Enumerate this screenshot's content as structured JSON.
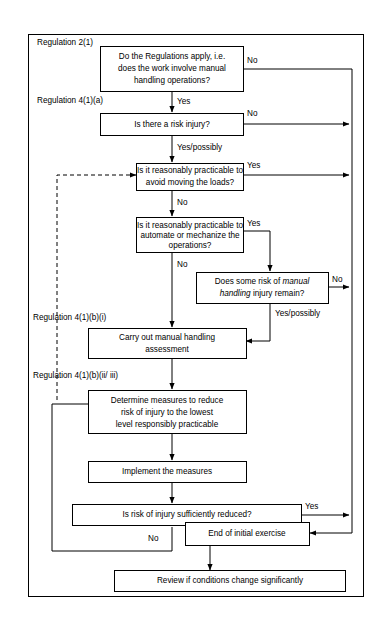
{
  "diagram": {
    "colors": {
      "line": "#000000",
      "box_fill": "#ffffff",
      "background": "#ffffff"
    },
    "section_labels": [
      {
        "id": "reg-2-1",
        "text": "Regulation 2(1)"
      },
      {
        "id": "reg-4-1-a",
        "text": "Regulation 4(1)(a)"
      },
      {
        "id": "reg-4-1-b-i",
        "text": "Regulation 4(1)(b)(i)"
      },
      {
        "id": "reg-4-1-b-ii-iii",
        "text": "Regulation 4(1)(b)(ii/ iii)"
      }
    ],
    "nodes": [
      {
        "id": "regulations-apply",
        "kind": "decision",
        "lines": [
          "Do the Regulations apply, i.e.",
          "does the work involve manual",
          "handling operations?"
        ]
      },
      {
        "id": "risk-injury",
        "kind": "decision",
        "lines": [
          "Is there a risk injury?"
        ]
      },
      {
        "id": "avoid-moving-loads",
        "kind": "decision",
        "lines": [
          "Is it reasonably practicable to",
          "avoid moving the loads?"
        ]
      },
      {
        "id": "automate-mechanize",
        "kind": "decision",
        "lines": [
          "Is it reasonably practicable to",
          "automate or mechanize the",
          "operations?"
        ]
      },
      {
        "id": "risk-remains",
        "kind": "decision",
        "lines_rich": [
          [
            {
              "t": "Does some risk of ",
              "style": "normal"
            },
            {
              "t": "manual",
              "style": "italic"
            }
          ],
          [
            {
              "t": "handling",
              "style": "italic"
            },
            {
              "t": " injury remain?",
              "style": "normal"
            }
          ]
        ]
      },
      {
        "id": "carry-out-assessment",
        "kind": "process",
        "lines": [
          "Carry out manual handling",
          "assessment"
        ]
      },
      {
        "id": "determine-measures",
        "kind": "process",
        "lines": [
          "Determine measures to reduce",
          "risk of injury to the lowest",
          "level responsibly practicable"
        ]
      },
      {
        "id": "implement-measures",
        "kind": "process",
        "lines": [
          "Implement the measures"
        ]
      },
      {
        "id": "risk-sufficiently-reduced",
        "kind": "decision",
        "lines": [
          "Is risk of injury sufficiently reduced?"
        ]
      },
      {
        "id": "end-initial-exercise",
        "kind": "terminal",
        "lines": [
          "End of initial exercise"
        ]
      },
      {
        "id": "review-conditions",
        "kind": "terminal",
        "lines": [
          "Review if conditions change significantly"
        ]
      }
    ],
    "edge_labels": [
      {
        "id": "regulations-apply-no",
        "text": "No"
      },
      {
        "id": "regulations-apply-yes",
        "text": "Yes"
      },
      {
        "id": "risk-injury-no",
        "text": "No"
      },
      {
        "id": "risk-injury-yes",
        "text": "Yes/possibly"
      },
      {
        "id": "avoid-moving-loads-yes",
        "text": "Yes"
      },
      {
        "id": "avoid-moving-loads-no",
        "text": "No"
      },
      {
        "id": "automate-mechanize-yes",
        "text": "Yes"
      },
      {
        "id": "automate-mechanize-no",
        "text": "No"
      },
      {
        "id": "risk-remains-no",
        "text": "No"
      },
      {
        "id": "risk-remains-yes",
        "text": "Yes/possibly"
      },
      {
        "id": "risk-reduced-yes",
        "text": "Yes"
      },
      {
        "id": "risk-reduced-no",
        "text": "No"
      }
    ]
  }
}
